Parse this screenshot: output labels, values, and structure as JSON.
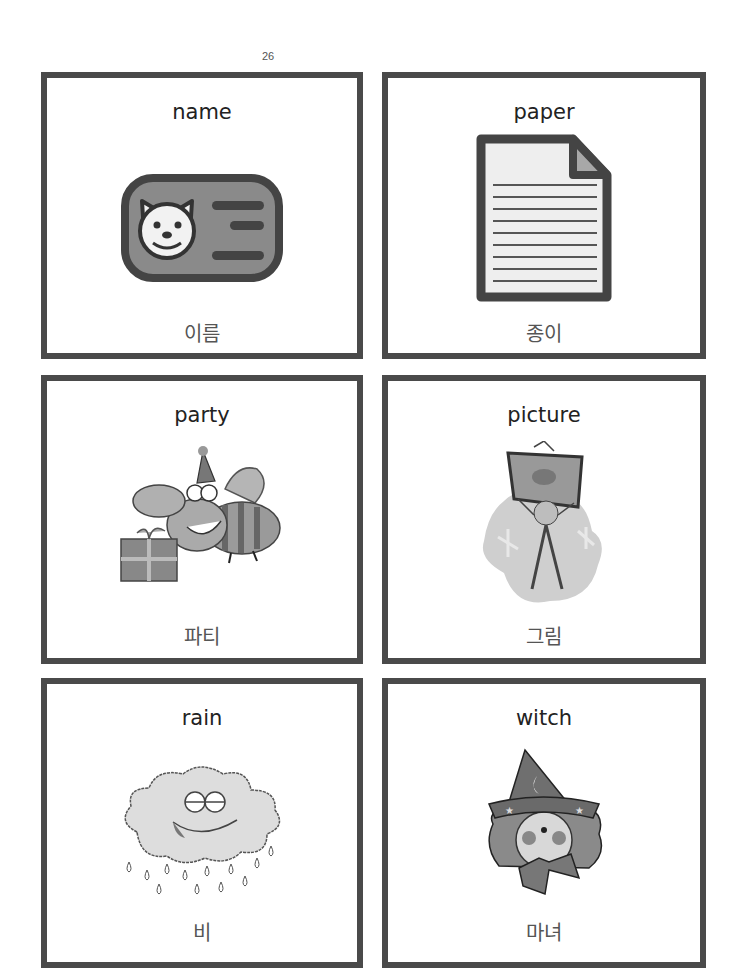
{
  "page_number": "26",
  "border_color": "#4a4a4a",
  "cards": [
    {
      "english": "name",
      "korean": "이름",
      "icon": "id-card-dog-icon"
    },
    {
      "english": "paper",
      "korean": "종이",
      "icon": "paper-document-icon"
    },
    {
      "english": "party",
      "korean": "파티",
      "icon": "party-bee-gift-icon"
    },
    {
      "english": "picture",
      "korean": "그림",
      "icon": "person-holding-picture-icon"
    },
    {
      "english": "rain",
      "korean": "비",
      "icon": "rain-cloud-icon"
    },
    {
      "english": "witch",
      "korean": "마녀",
      "icon": "witch-face-icon"
    }
  ]
}
